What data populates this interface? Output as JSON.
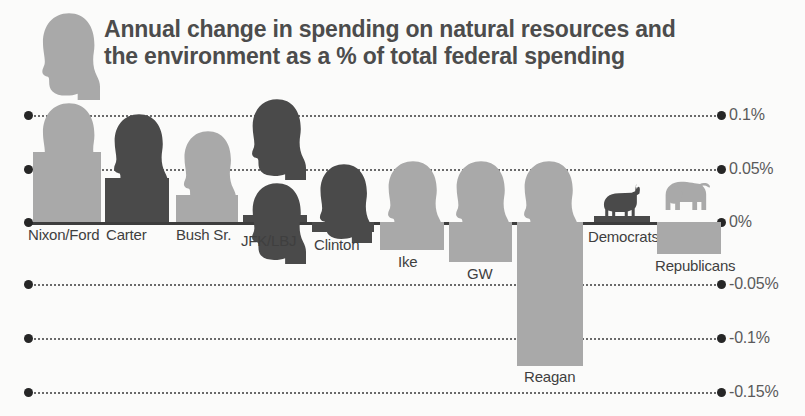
{
  "title": {
    "line1": "Annual change in spending on natural resources and",
    "line2": "the environment as a % of total federal spending"
  },
  "colors": {
    "light_gray": "#a9a9a9",
    "dark_gray": "#4a4a4a",
    "axis": "#3d3d3d",
    "text": "#4c4c4c",
    "background": "#fbfbfa"
  },
  "chart_data": {
    "type": "bar",
    "title": "Annual change in spending on natural resources and the environment as a % of total federal spending",
    "xlabel": "",
    "ylabel": "",
    "ylim": [
      -0.15,
      0.1
    ],
    "grid": true,
    "legend_position": "inline-right",
    "yticks": [
      "0.1%",
      "0.05%",
      "0%",
      "-0.05%",
      "-0.1%",
      "-0.15%"
    ],
    "ytick_values": [
      0.1,
      0.05,
      0,
      -0.05,
      -0.1,
      -0.15
    ],
    "categories": [
      "Nixon/Ford",
      "Carter",
      "Bush Sr.",
      "JFK/LBJ",
      "Clinton",
      "Ike",
      "GW",
      "Reagan"
    ],
    "values": [
      0.065,
      0.041,
      0.025,
      0.006,
      -0.008,
      -0.026,
      -0.037,
      -0.133
    ],
    "party": [
      "Republican",
      "Democrat",
      "Republican",
      "Democrat",
      "Democrat",
      "Republican",
      "Republican",
      "Republican"
    ],
    "legend": [
      {
        "label": "Democrats",
        "value": 0.005,
        "color": "#4a4a4a",
        "icon": "donkey-icon"
      },
      {
        "label": "Republicans",
        "value": -0.029,
        "color": "#a9a9a9",
        "icon": "elephant-icon"
      }
    ]
  },
  "axis": [
    {
      "label": "0.1%",
      "value": 0.1,
      "y": 115,
      "zero": false
    },
    {
      "label": "0.05%",
      "value": 0.05,
      "y": 169,
      "zero": false
    },
    {
      "label": "0%",
      "value": 0,
      "y": 222,
      "zero": true
    },
    {
      "label": "-0.05%",
      "value": -0.05,
      "y": 284,
      "zero": false
    },
    {
      "label": "-0.1%",
      "value": -0.1,
      "y": 338,
      "zero": false
    },
    {
      "label": "-0.15%",
      "value": -0.15,
      "y": 392,
      "zero": false
    }
  ],
  "bars": [
    {
      "name": "Nixon/Ford",
      "value": 0.065,
      "tone": "light",
      "x": 33,
      "w": 68,
      "top": 152,
      "bottom": 222,
      "label_x": 28,
      "label_y": 226,
      "heads": 2,
      "head_x": 38,
      "head_y": 12,
      "head_w": 62,
      "head_h": 88
    },
    {
      "name": "Carter",
      "value": 0.041,
      "tone": "dark",
      "x": 105,
      "w": 64,
      "top": 178,
      "bottom": 222,
      "label_x": 106,
      "label_y": 226,
      "heads": 1,
      "head_x": 110,
      "head_y": 113,
      "head_w": 58,
      "head_h": 82
    },
    {
      "name": "Bush Sr.",
      "value": 0.025,
      "tone": "light",
      "x": 176,
      "w": 62,
      "top": 195,
      "bottom": 222,
      "label_x": 176,
      "label_y": 226,
      "heads": 1,
      "head_x": 180,
      "head_y": 130,
      "head_w": 56,
      "head_h": 80
    },
    {
      "name": "JFK/LBJ",
      "value": 0.006,
      "tone": "dark",
      "x": 243,
      "w": 64,
      "top": 215,
      "bottom": 222,
      "label_x": 241,
      "label_y": 232,
      "heads": 2,
      "head_x": 248,
      "head_y": 98,
      "head_w": 58,
      "head_h": 82
    },
    {
      "name": "Clinton",
      "value": -0.008,
      "tone": "dark",
      "x": 312,
      "w": 62,
      "top": 222,
      "bottom": 232,
      "label_x": 314,
      "label_y": 236,
      "heads": 1,
      "head_x": 316,
      "head_y": 163,
      "head_w": 56,
      "head_h": 80
    },
    {
      "name": "Ike",
      "value": -0.026,
      "tone": "light",
      "x": 380,
      "w": 64,
      "top": 222,
      "bottom": 250,
      "label_x": 398,
      "label_y": 253,
      "heads": 1,
      "head_x": 384,
      "head_y": 160,
      "head_w": 58,
      "head_h": 80
    },
    {
      "name": "GW",
      "value": -0.037,
      "tone": "light",
      "x": 449,
      "w": 63,
      "top": 222,
      "bottom": 262,
      "label_x": 467,
      "label_y": 265,
      "heads": 1,
      "head_x": 452,
      "head_y": 160,
      "head_w": 58,
      "head_h": 80
    },
    {
      "name": "Reagan",
      "value": -0.133,
      "tone": "light",
      "x": 517,
      "w": 66,
      "top": 222,
      "bottom": 366,
      "label_x": 524,
      "label_y": 368,
      "heads": 1,
      "head_x": 520,
      "head_y": 160,
      "head_w": 58,
      "head_h": 80
    },
    {
      "name": "Democrats",
      "value": 0.005,
      "tone": "dark",
      "x": 594,
      "w": 56,
      "top": 216,
      "bottom": 222,
      "label_x": 588,
      "label_y": 228,
      "heads": 0,
      "head_x": 0,
      "head_y": 0,
      "head_w": 0,
      "head_h": 0
    },
    {
      "name": "Republicans",
      "value": -0.029,
      "tone": "light",
      "x": 657,
      "w": 64,
      "top": 222,
      "bottom": 254,
      "label_x": 655,
      "label_y": 257,
      "heads": 0,
      "head_x": 0,
      "head_y": 0,
      "head_w": 0,
      "head_h": 0
    }
  ],
  "legend_icons": {
    "donkey": {
      "x": 597,
      "y": 182,
      "w": 52,
      "h": 36
    },
    "elephant": {
      "x": 658,
      "y": 180,
      "w": 62,
      "h": 42
    }
  }
}
